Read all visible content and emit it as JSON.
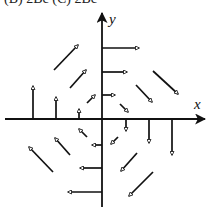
{
  "header": {
    "clipped_text": "(B) 2Bc    (C) 2Bc"
  },
  "axes": {
    "x_label": "x",
    "y_label": "y",
    "origin": [
      102,
      119
    ],
    "x_axis": {
      "from": [
        5,
        119
      ],
      "to": [
        205,
        119
      ]
    },
    "y_axis": {
      "from": [
        102,
        207
      ],
      "to": [
        102,
        13
      ]
    }
  },
  "colors": {
    "ink": "#111111",
    "background": "#ffffff"
  },
  "vector_field": {
    "description": "Rotational (clockwise) vector field around origin; arrow magnitude grows with distance",
    "arrows": [
      {
        "from": [
          102,
          48
        ],
        "to": [
          139,
          48
        ],
        "direction": "right"
      },
      {
        "from": [
          102,
          72
        ],
        "to": [
          127,
          72
        ],
        "direction": "right"
      },
      {
        "from": [
          102,
          95
        ],
        "to": [
          115,
          95
        ],
        "direction": "right"
      },
      {
        "from": [
          102,
          145
        ],
        "to": [
          92,
          145
        ],
        "direction": "left"
      },
      {
        "from": [
          102,
          168
        ],
        "to": [
          80,
          168
        ],
        "direction": "left"
      },
      {
        "from": [
          102,
          192
        ],
        "to": [
          68,
          192
        ],
        "direction": "left"
      },
      {
        "from": [
          33,
          119
        ],
        "to": [
          33,
          86
        ],
        "direction": "up"
      },
      {
        "from": [
          56,
          119
        ],
        "to": [
          56,
          97
        ],
        "direction": "up"
      },
      {
        "from": [
          79,
          119
        ],
        "to": [
          79,
          109
        ],
        "direction": "up"
      },
      {
        "from": [
          126,
          119
        ],
        "to": [
          126,
          131
        ],
        "direction": "down"
      },
      {
        "from": [
          149,
          119
        ],
        "to": [
          149,
          143
        ],
        "direction": "down"
      },
      {
        "from": [
          172,
          119
        ],
        "to": [
          172,
          155
        ],
        "direction": "down"
      },
      {
        "from": [
          54,
          70
        ],
        "to": [
          78,
          45
        ],
        "direction": "up-right"
      },
      {
        "from": [
          70,
          88
        ],
        "to": [
          86,
          70
        ],
        "direction": "up-right"
      },
      {
        "from": [
          87,
          103
        ],
        "to": [
          95,
          95
        ],
        "direction": "up-right"
      },
      {
        "from": [
          153,
          71
        ],
        "to": [
          178,
          94
        ],
        "direction": "down-right"
      },
      {
        "from": [
          136,
          85
        ],
        "to": [
          152,
          102
        ],
        "direction": "down-right"
      },
      {
        "from": [
          120,
          104
        ],
        "to": [
          128,
          112
        ],
        "direction": "down-right"
      },
      {
        "from": [
          87,
          137
        ],
        "to": [
          79,
          129
        ],
        "direction": "up-left"
      },
      {
        "from": [
          70,
          155
        ],
        "to": [
          55,
          138
        ],
        "direction": "up-left"
      },
      {
        "from": [
          53,
          172
        ],
        "to": [
          29,
          147
        ],
        "direction": "up-left"
      },
      {
        "from": [
          118,
          137
        ],
        "to": [
          111,
          144
        ],
        "direction": "down-left"
      },
      {
        "from": [
          137,
          153
        ],
        "to": [
          121,
          171
        ],
        "direction": "down-left"
      },
      {
        "from": [
          153,
          172
        ],
        "to": [
          129,
          196
        ],
        "direction": "down-left"
      }
    ]
  }
}
